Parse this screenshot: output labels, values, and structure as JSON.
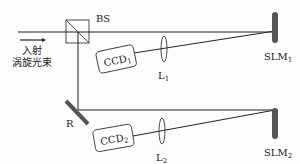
{
  "diagram": {
    "type": "optical setup schematic",
    "input_label_line1": "入射",
    "input_label_line2": "涡旋光束",
    "beam_splitter": "BS",
    "mirror": "R",
    "ccd1": {
      "base": "CCD",
      "sub": "1"
    },
    "ccd2": {
      "base": "CCD",
      "sub": "2"
    },
    "lens1": {
      "base": "L",
      "sub": "1"
    },
    "lens2": {
      "base": "L",
      "sub": "2"
    },
    "slm1": {
      "base": "SLM",
      "sub": "1"
    },
    "slm2": {
      "base": "SLM",
      "sub": "2"
    },
    "colors": {
      "line": "#222222",
      "slm": "#555555",
      "mirror": "#555555"
    }
  }
}
